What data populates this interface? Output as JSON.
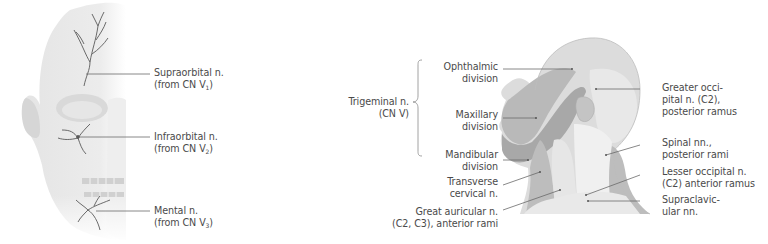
{
  "left_figure": {
    "subject": "anterior-view-face-half-skull",
    "labels": [
      {
        "line1": "Supraorbital n.",
        "line2_prefix": "(from CN V",
        "line2_sub": "1",
        "line2_suffix": ")"
      },
      {
        "line1": "Infraorbital n.",
        "line2_prefix": "(from CN V",
        "line2_sub": "2",
        "line2_suffix": ")"
      },
      {
        "line1": "Mental n.",
        "line2_prefix": "(from CN V",
        "line2_sub": "3",
        "line2_suffix": ")"
      }
    ]
  },
  "right_figure": {
    "subject": "lateral-view-head-neck-dermatomes",
    "group_label": {
      "line1": "Trigeminal n.",
      "line2": "(CN V)"
    },
    "left_labels": [
      {
        "line1": "Ophthalmic",
        "line2": "division"
      },
      {
        "line1": "Maxillary",
        "line2": "division"
      },
      {
        "line1": "Mandibular",
        "line2": "division"
      },
      {
        "line1": "Transverse",
        "line2": "cervical n."
      },
      {
        "line1": "Great auricular n.",
        "line2": "(C2, C3), anterior rami"
      }
    ],
    "right_labels": [
      {
        "line1": "Greater occi-",
        "line2": "pital n. (C2),",
        "line3": "posterior ramus"
      },
      {
        "line1": "Spinal nn.,",
        "line2": "posterior rami"
      },
      {
        "line1": "Lesser occipital n.",
        "line2": "(C2) anterior ramus"
      },
      {
        "line1": "Supraclavic-",
        "line2": "ular nn."
      }
    ]
  },
  "colors": {
    "text": "#4a4a4a",
    "leader": "#6a6a6a",
    "ophthalmic": "#dcdcdc",
    "maxillary": "#b9b9b9",
    "mandibular": "#a8a8a8",
    "cervical_light": "#e6e6e6",
    "cervical_mid": "#cfcfcf",
    "cervical_dark": "#bdbdbd"
  }
}
